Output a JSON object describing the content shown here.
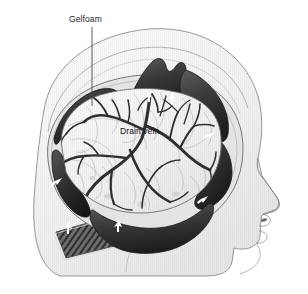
{
  "figure": {
    "background_color": "#ffffff",
    "width": 308,
    "height": 294
  },
  "labels": [
    {
      "id": "gelfoam",
      "text": "Gelfoam",
      "color": "#1d1d1d",
      "leader_line": {
        "x1": 92,
        "y1": 27,
        "x2": 92,
        "y2": 106,
        "color": "#4a4a4a"
      }
    },
    {
      "id": "drain_vein",
      "text": "Drain vein",
      "color": "#111111",
      "leader_line": null
    }
  ],
  "anatomy": {
    "scalp_color": "#f4f4f4",
    "scalp_outline_color": "#8d8d8d",
    "brain_surface_color": "#f3f3f3",
    "brain_outline_color": "#6f6f6f",
    "vein_color": "#2f2f2f",
    "minor_vessel_color": "#9a9a9a",
    "dura_flap_color": "#3a3a3a",
    "dura_flap_dark_color": "#232323",
    "bone_hatch_color": "#5a5a5a",
    "arrow_marker_color": "#ffffff",
    "ear_outline_color": "#9e9e9e"
  },
  "markers": {
    "arrow_count": 7,
    "description": "white arrow markers on reflected dura flaps"
  }
}
